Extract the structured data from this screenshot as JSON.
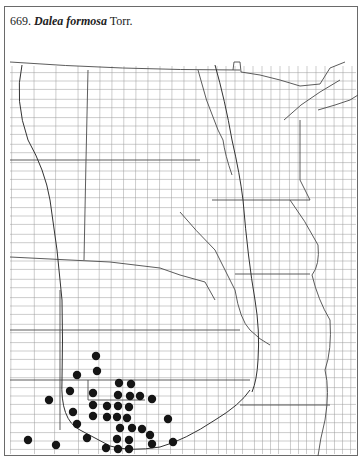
{
  "map": {
    "number": "669.",
    "species_name": "Dalea formosa",
    "authority": "Torr.",
    "region": "Great Plains and upper Midwest, county outline map",
    "line_color": "#8a8a8a",
    "dot_color": "#151515",
    "occurrences_note": "Dots mark county records; concentrated in southwest of map",
    "occurrence_count": 37
  }
}
